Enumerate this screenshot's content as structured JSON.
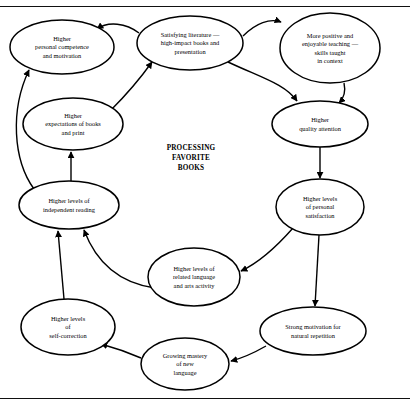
{
  "page": {
    "center_label_lines": [
      "PROCESSING",
      "FAVORITE",
      "BOOKS"
    ],
    "rules": {
      "top": "horizontal-rule",
      "bottom": "horizontal-rule"
    }
  },
  "diagram": {
    "type": "cycle-flowchart",
    "node_shape": "ellipse",
    "arrow_style": "single-headed",
    "nodes": [
      {
        "id": "competence",
        "lines": [
          "Higher",
          "personal competence",
          "and motivation"
        ],
        "cx": 62,
        "cy": 47,
        "rx": 52,
        "ry": 27
      },
      {
        "id": "literature",
        "lines": [
          "Satisfying literature —",
          "high-impact books and",
          "presentation"
        ],
        "cx": 190,
        "cy": 43,
        "rx": 53,
        "ry": 27
      },
      {
        "id": "teaching",
        "lines": [
          "More positive and",
          "enjoyable teaching —",
          "skills taught",
          "in context"
        ],
        "cx": 330,
        "cy": 48,
        "rx": 50,
        "ry": 35
      },
      {
        "id": "expectations",
        "lines": [
          "Higher",
          "expectations of books",
          "and print"
        ],
        "cx": 73,
        "cy": 124,
        "rx": 50,
        "ry": 26
      },
      {
        "id": "attention",
        "lines": [
          "Higher",
          "quality attention"
        ],
        "cx": 320,
        "cy": 124,
        "rx": 48,
        "ry": 23
      },
      {
        "id": "reading",
        "lines": [
          "Higher levels of",
          "independent reading"
        ],
        "cx": 69,
        "cy": 205,
        "rx": 50,
        "ry": 24
      },
      {
        "id": "satisfaction",
        "lines": [
          "Higher levels",
          "of personal",
          "satisfaction"
        ],
        "cx": 320,
        "cy": 207,
        "rx": 44,
        "ry": 28
      },
      {
        "id": "language",
        "lines": [
          "Higher levels of",
          "related language",
          "and arts activity"
        ],
        "cx": 194,
        "cy": 277,
        "rx": 46,
        "ry": 29
      },
      {
        "id": "repetition",
        "lines": [
          "Strong motivation for",
          "natural repetition"
        ],
        "cx": 313,
        "cy": 331,
        "rx": 53,
        "ry": 24
      },
      {
        "id": "selfcorrect",
        "lines": [
          "Higher levels",
          "of",
          "self-correction"
        ],
        "cx": 68,
        "cy": 327,
        "rx": 47,
        "ry": 28
      },
      {
        "id": "mastery",
        "lines": [
          "Growing mastery",
          "of new",
          "language"
        ],
        "cx": 185,
        "cy": 364,
        "rx": 44,
        "ry": 26
      }
    ],
    "edges": [
      {
        "from": "literature",
        "to": "competence"
      },
      {
        "from": "literature",
        "to": "teaching"
      },
      {
        "from": "teaching",
        "to": "attention"
      },
      {
        "from": "literature",
        "to": "attention"
      },
      {
        "from": "attention",
        "to": "satisfaction"
      },
      {
        "from": "satisfaction",
        "to": "language"
      },
      {
        "from": "satisfaction",
        "to": "repetition"
      },
      {
        "from": "repetition",
        "to": "mastery"
      },
      {
        "from": "mastery",
        "to": "selfcorrect"
      },
      {
        "from": "selfcorrect",
        "to": "reading"
      },
      {
        "from": "language",
        "to": "reading"
      },
      {
        "from": "reading",
        "to": "expectations"
      },
      {
        "from": "reading",
        "to": "competence"
      },
      {
        "from": "expectations",
        "to": "literature"
      }
    ]
  },
  "colors": {
    "background": "#ffffff",
    "stroke": "#000000",
    "text": "#000000"
  }
}
